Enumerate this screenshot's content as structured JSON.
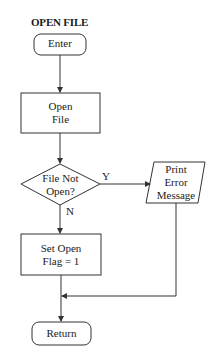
{
  "title": "OPEN FILE",
  "nodes": {
    "enter": {
      "type": "terminal",
      "label": "Enter"
    },
    "open_file": {
      "type": "process",
      "label": "Open\nFile"
    },
    "decision": {
      "type": "decision",
      "label": "File Not\nOpen?"
    },
    "print_error": {
      "type": "io",
      "label": "Print\nError\nMessage"
    },
    "set_flag": {
      "type": "process",
      "label": "Set Open\nFlag = 1"
    },
    "return": {
      "type": "terminal",
      "label": "Return"
    }
  },
  "edges": {
    "yes_label": "Y",
    "no_label": "N"
  },
  "colors": {
    "stroke": "#333333",
    "background": "#ffffff"
  }
}
